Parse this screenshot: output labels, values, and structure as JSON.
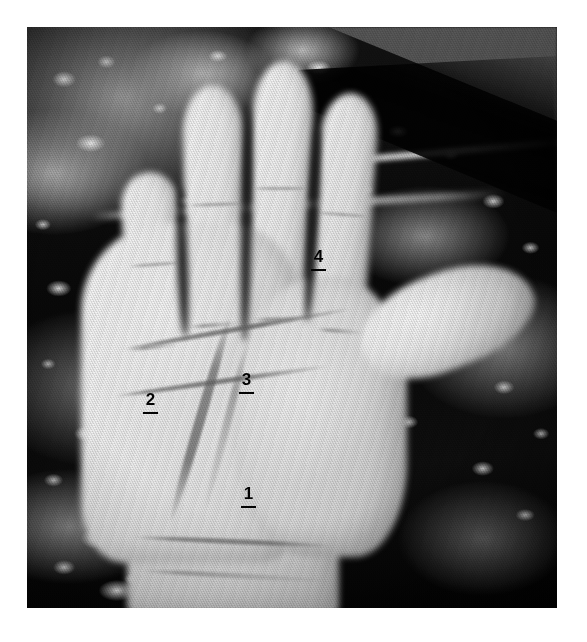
{
  "figure": {
    "kind": "photograph",
    "rendering": "black-and-white halftone / scanned print",
    "frame": {
      "page_background": "#ffffff",
      "photo_left": 27,
      "photo_top": 27,
      "photo_width": 530,
      "photo_height": 581
    },
    "palette": {
      "page": "#ffffff",
      "skin_light": "#f1eee9",
      "skin_mid": "#ddd8d0",
      "skin_shadow": "#c6c0b6",
      "background_dark": "#101010",
      "background_highlight": "#ececec",
      "sky_wedge_gray": "#6f6f6f",
      "annotation_ink": "#0a0a0a"
    }
  },
  "annotations": {
    "style": {
      "form": "bold numeral above a short horizontal rule",
      "color": "#0a0a0a",
      "font_size_px": 17,
      "rule_width_px": 15,
      "rule_height_px": 2
    },
    "items": [
      {
        "id": "annotation-1",
        "label": "1",
        "region": "proximal palm above the wrist creases",
        "x": 241,
        "y": 485
      },
      {
        "id": "annotation-2",
        "label": "2",
        "region": "ulnar (little-finger side) border of the palm",
        "x": 143,
        "y": 391
      },
      {
        "id": "annotation-3",
        "label": "3",
        "region": "central palm between the transverse creases",
        "x": 239,
        "y": 371
      },
      {
        "id": "annotation-4",
        "label": "4",
        "region": "upper palm below the base of the index finger",
        "x": 311,
        "y": 248
      }
    ]
  },
  "hand": {
    "orientation": "palm facing viewer, fingers up, thumb toward the right",
    "visible_parts": [
      "index-finger",
      "middle-finger",
      "ring-finger",
      "little-finger",
      "thumb",
      "palm",
      "thenar-eminence",
      "wrist"
    ],
    "creases": [
      "distal-transverse-crease",
      "proximal-transverse-crease",
      "thenar-crease",
      "secondary-thenar-crease",
      "wrist-crease-upper",
      "wrist-crease-lower",
      "finger-base-creases",
      "knuckle-creases"
    ]
  },
  "background": {
    "description": "dark blurred rocky ground with scattered bright pebble highlights",
    "features": [
      "pale-branch-upper",
      "pale-branch-secondary",
      "gray-wedge-top-right",
      "dark-ridge-top-right",
      "pebble-speckles"
    ]
  }
}
